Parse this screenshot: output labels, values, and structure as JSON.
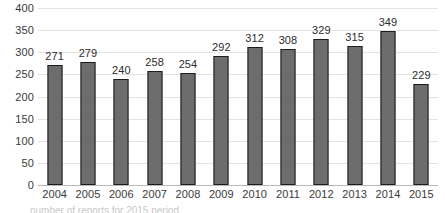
{
  "chart_data": {
    "type": "bar",
    "title": "",
    "xlabel": "",
    "ylabel": "",
    "categories": [
      "2004",
      "2005",
      "2006",
      "2007",
      "2008",
      "2009",
      "2010",
      "2011",
      "2012",
      "2013",
      "2014",
      "2015"
    ],
    "values": [
      271,
      279,
      240,
      258,
      254,
      292,
      312,
      308,
      329,
      315,
      349,
      229
    ],
    "data_labels": [
      "271",
      "279",
      "240",
      "258",
      "254",
      "292",
      "312",
      "308",
      "329",
      "315",
      "349",
      "229"
    ],
    "ylim": [
      0,
      400
    ],
    "y_ticks": [
      400,
      350,
      300,
      250,
      200,
      150,
      100,
      50,
      0
    ],
    "y_tick_labels": [
      "400",
      "350",
      "300",
      "250",
      "200",
      "150",
      "100",
      "50",
      "0"
    ],
    "grid": true,
    "legend": false,
    "legend_position": "none",
    "series": [
      {
        "name": "",
        "values": [
          271,
          279,
          240,
          258,
          254,
          292,
          312,
          308,
          329,
          315,
          349,
          229
        ]
      }
    ],
    "colors": {
      "bar_fill": "#6d6d6d",
      "bar_outline": "#1d1d1d",
      "gridline": "#e3e3e3",
      "baseline": "#b9b9b9",
      "tick_text": "#3a3a3a",
      "label_text": "#2c2c2c",
      "background": "#ffffff"
    }
  },
  "caption": {
    "cropped_text": "number of reports for 2015 period"
  }
}
